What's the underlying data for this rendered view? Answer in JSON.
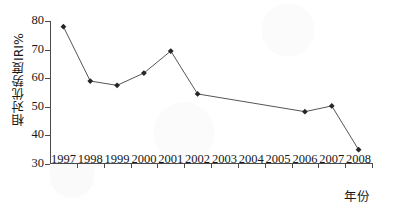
{
  "chart_data": {
    "type": "line",
    "title": "",
    "xlabel": "年份",
    "ylabel": "相对优势度IRI%",
    "x": [
      1997,
      1998,
      1999,
      2000,
      2001,
      2002,
      2003,
      2004,
      2005,
      2006,
      2007,
      2008
    ],
    "categories": [
      "1997",
      "1998",
      "1999",
      "2000",
      "2001",
      "2002",
      "2003",
      "2004",
      "2005",
      "2006",
      "2007",
      "2008"
    ],
    "series": [
      {
        "name": "相对优势度IRI%",
        "values": [
          78.0,
          59.0,
          57.5,
          61.8,
          69.5,
          54.5,
          null,
          null,
          null,
          48.3,
          50.3,
          35.0
        ],
        "marker": "diamond",
        "marker_color": "#262626",
        "line_color": "#555555"
      }
    ],
    "ylim": [
      30,
      80
    ],
    "yticks": [
      30,
      40,
      50,
      60,
      70,
      80
    ],
    "ytick_labels": [
      "30",
      "40",
      "50",
      "60",
      "70",
      "80"
    ],
    "xlim": [
      1996.5,
      2008.5
    ],
    "grid": false,
    "legend": false,
    "axes_style": "left-bottom-only",
    "tick_direction": "out",
    "note": "markers drawn for 1997-2002 and 2006-2008; straight interpolated segment spans 2002 to 2006 with no intermediate markers"
  }
}
